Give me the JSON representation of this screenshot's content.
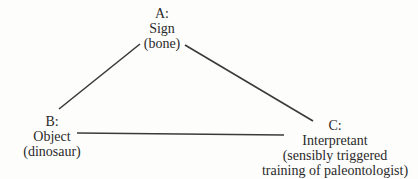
{
  "diagram": {
    "type": "triangle",
    "nodes": {
      "a": {
        "id": "A:",
        "label": "Sign",
        "example": "(bone)"
      },
      "b": {
        "id": "B:",
        "label": "Object",
        "example": "(dinosaur)"
      },
      "c": {
        "id": "C:",
        "label": "Interpretant",
        "example_line1": "(sensibly triggered",
        "example_line2": "training of paleontologist)"
      }
    },
    "edges": [
      {
        "from": "A",
        "to": "B"
      },
      {
        "from": "A",
        "to": "C"
      },
      {
        "from": "B",
        "to": "C"
      }
    ],
    "line_color": "#3a3a3a"
  }
}
